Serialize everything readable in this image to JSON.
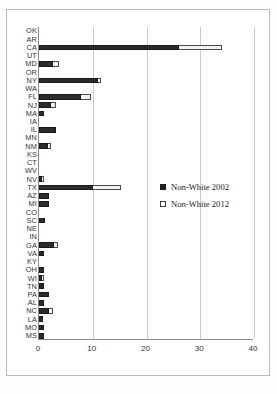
{
  "chart_data": {
    "type": "bar",
    "orientation": "horizontal",
    "title": "",
    "xlabel": "",
    "ylabel": "",
    "xlim": [
      0,
      40
    ],
    "xticks": [
      0,
      10,
      20,
      30,
      40
    ],
    "grid": true,
    "legend_position": "center-right",
    "categories": [
      "OK",
      "AR",
      "CA",
      "UT",
      "MD",
      "OR",
      "NY",
      "WA",
      "FL",
      "NJ",
      "MA",
      "IA",
      "IL",
      "MN",
      "NM",
      "KS",
      "CT",
      "WV",
      "NV",
      "TX",
      "AZ",
      "MI",
      "CO",
      "SC",
      "NE",
      "IN",
      "GA",
      "VA",
      "KY",
      "OH",
      "WI",
      "TN",
      "PA",
      "AL",
      "NC",
      "LA",
      "MO",
      "MS"
    ],
    "series": [
      {
        "name": "Non-White 2002",
        "color": "#2b2b2b",
        "values": [
          0,
          0,
          26.0,
          0,
          2.6,
          0,
          11.0,
          0,
          7.8,
          2.3,
          1.0,
          0,
          3.2,
          0,
          1.6,
          0,
          0,
          0,
          0.4,
          10.0,
          1.9,
          1.9,
          0,
          1.1,
          0,
          0,
          2.8,
          1.0,
          0,
          0.9,
          0.2,
          0.9,
          1.9,
          0.9,
          1.9,
          0.8,
          0.9,
          0.9
        ]
      },
      {
        "name": "Non-White 2012",
        "color": "#f2f2f2",
        "values": [
          0,
          0,
          34.0,
          0,
          3.7,
          0,
          11.6,
          0,
          9.7,
          3.1,
          0,
          0,
          0,
          0,
          2.2,
          0,
          0,
          0,
          1.0,
          15.3,
          0,
          0,
          0,
          0,
          0,
          0,
          3.5,
          0,
          0,
          0,
          1.0,
          0,
          0,
          0,
          2.6,
          0,
          0,
          0
        ]
      }
    ],
    "legend": [
      {
        "label": "Non-White 2002",
        "marker": "filled-square"
      },
      {
        "label": "Non-White 2012",
        "marker": "open-square"
      }
    ],
    "xtick_labels": [
      "0",
      "10",
      "20",
      "30",
      "40"
    ]
  }
}
